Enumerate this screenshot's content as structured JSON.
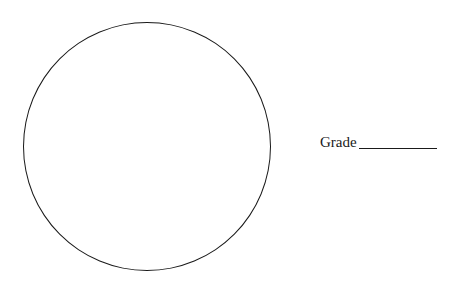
{
  "worksheet": {
    "shape": "circle",
    "grade_field": {
      "label": "Grade",
      "value": ""
    }
  },
  "colors": {
    "ink": "#1a1a1a",
    "background": "#ffffff"
  }
}
